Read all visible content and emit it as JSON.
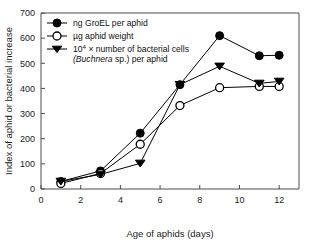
{
  "chart_data": {
    "type": "line",
    "title": "",
    "xlabel": "Age of aphids (days)",
    "ylabel": "Index of aphid or bacterial increase",
    "xlim": [
      0,
      13
    ],
    "ylim": [
      0,
      700
    ],
    "xticks": [
      0,
      2,
      4,
      6,
      8,
      10,
      12
    ],
    "xtick_labels": [
      "0",
      "2",
      "4",
      "6",
      "8",
      "10",
      "12"
    ],
    "yticks": [
      0,
      100,
      200,
      300,
      400,
      500,
      600,
      700
    ],
    "ytick_labels": [
      "0",
      "100",
      "200",
      "300",
      "400",
      "500",
      "600",
      "700"
    ],
    "grid": false,
    "legend_position": "top-left",
    "x": [
      1,
      3,
      5,
      7,
      9,
      11,
      12
    ],
    "series": [
      {
        "name": "ng GroEL per aphid",
        "marker": "filled-circle",
        "values": [
          30,
          72,
          222,
          415,
          610,
          530,
          532
        ]
      },
      {
        "name": "µg aphid weight",
        "marker": "open-circle",
        "values": [
          22,
          62,
          178,
          332,
          403,
          408,
          408
        ]
      },
      {
        "name": "10⁴ × number of bacterial cells (Buchnera sp.) per aphid",
        "marker": "filled-triangle-down",
        "values": [
          30,
          58,
          102,
          415,
          488,
          420,
          428
        ]
      }
    ]
  },
  "legend": {
    "entries": [
      {
        "marker": "filled-circle",
        "text": "ng GroEL per aphid",
        "line2": ""
      },
      {
        "marker": "open-circle",
        "text": "µg aphid weight",
        "line2": ""
      },
      {
        "marker": "filled-triangle-down",
        "text_pre": "10",
        "text_sup": "4",
        "text_post": " × number of bacterial cells",
        "line2_ital": "(Buchnera",
        "line2_post": " sp.) per aphid"
      }
    ]
  },
  "axes": {
    "x_title": "Age of aphids (days)",
    "y_title": "Index of aphid or bacterial increase"
  },
  "colors": {
    "marker": "#000000",
    "line": "#000000",
    "axis": "#4d4d4d",
    "background": "#ffffff"
  }
}
